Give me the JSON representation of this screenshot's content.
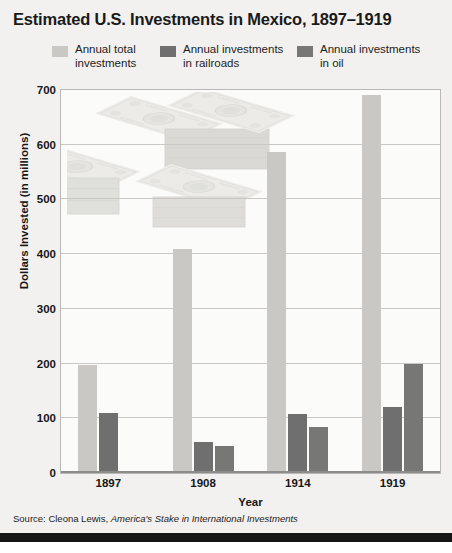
{
  "title": "Estimated U.S. Investments in Mexico, 1897–1919",
  "legend": {
    "position": "top",
    "items": [
      {
        "label": "Annual total\ninvestments",
        "color": "#c9c8c4",
        "key": "total"
      },
      {
        "label": "Annual investments\nin railroads",
        "color": "#6f6f6f",
        "key": "railroads"
      },
      {
        "label": "Annual investments\nin oil",
        "color": "#777776",
        "key": "oil"
      }
    ]
  },
  "axes": {
    "y_title": "Dollars Invested (in millions)",
    "x_title": "Year",
    "y_ticks": [
      "0",
      "100",
      "200",
      "300",
      "400",
      "500",
      "600",
      "700"
    ],
    "x_ticks": [
      "1897",
      "1908",
      "1914",
      "1919"
    ]
  },
  "source": {
    "prefix": "Source: Cleona Lewis, ",
    "book": "America's Stake in International Investments"
  },
  "chart_data": {
    "type": "bar",
    "title": "Estimated U.S. Investments in Mexico, 1897–1919",
    "xlabel": "Year",
    "ylabel": "Dollars Invested (in millions)",
    "ylim": [
      0,
      700
    ],
    "ytick_step": 100,
    "grid": true,
    "legend_position": "top",
    "categories": [
      "1897",
      "1908",
      "1914",
      "1919"
    ],
    "series": [
      {
        "name": "Annual total investments",
        "color": "#c9c8c4",
        "values": [
          197,
          410,
          587,
          690
        ]
      },
      {
        "name": "Annual investments in railroads",
        "color": "#6f6f6f",
        "values": [
          110,
          57,
          107,
          120
        ]
      },
      {
        "name": "Annual investments in oil",
        "color": "#777776",
        "values": [
          3,
          50,
          85,
          200
        ]
      }
    ]
  }
}
